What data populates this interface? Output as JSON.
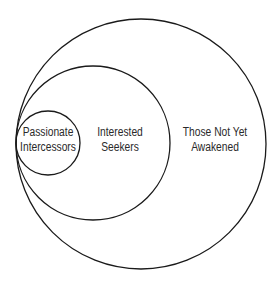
{
  "diagram": {
    "type": "nested-circles",
    "circles": [
      {
        "id": "outer",
        "label_lines": [
          "Those Not Yet",
          "Awakened"
        ],
        "cx": 141,
        "cy": 144,
        "r": 125
      },
      {
        "id": "middle",
        "label_lines": [
          "Interested",
          "Seekers"
        ],
        "cx": 93,
        "cy": 143,
        "r": 77
      },
      {
        "id": "inner",
        "label_lines": [
          "Passionate",
          "Intercessors"
        ],
        "cx": 48,
        "cy": 143,
        "r": 32
      }
    ],
    "stroke_color": "#1a1a1a",
    "text_color": "#2a2a2a",
    "background": "#ffffff"
  }
}
